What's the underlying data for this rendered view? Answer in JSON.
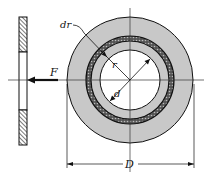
{
  "diagram": {
    "labels": {
      "ring_width": "dr",
      "radius": "r",
      "inner_diameter": "d",
      "outer_diameter": "D",
      "force": "F"
    },
    "colors": {
      "disk_fill": "#c8c8c8",
      "ring_dark": "#222222",
      "line": "#111111",
      "background": "#ffffff"
    },
    "geometry": {
      "center": [
        130,
        80
      ],
      "outer_radius": 63,
      "inner_radius": 30,
      "ring_radius": 41.5,
      "ring_thickness": 5
    }
  }
}
